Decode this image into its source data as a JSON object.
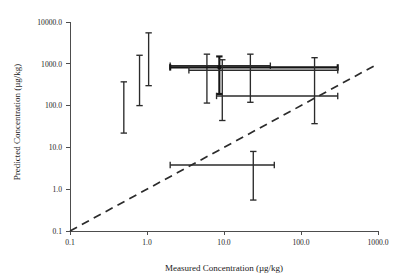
{
  "chart_data": {
    "type": "scatter",
    "title": "",
    "xlabel": "Measured Concentration (µg/kg)",
    "ylabel": "Predicted Concentration (µg/kg)",
    "xscale": "log",
    "yscale": "log",
    "xlim": [
      0.1,
      1000.0
    ],
    "ylim": [
      0.1,
      10000.0
    ],
    "grid": false,
    "legend": null,
    "x_tick_labels": [
      "0.1",
      "1.0",
      "10.0",
      "100.0",
      "1000.0"
    ],
    "x_tick_values": [
      0.1,
      1.0,
      10.0,
      100.0,
      1000.0
    ],
    "y_tick_labels": [
      "0.1",
      "1.0",
      "10.0",
      "100.0",
      "1000.0",
      "10000.0"
    ],
    "y_tick_values": [
      0.1,
      1.0,
      10.0,
      100.0,
      1000.0,
      10000.0
    ],
    "reference_line": {
      "name": "1:1 identity line",
      "style": "dashed",
      "from": [
        0.1,
        0.1
      ],
      "to": [
        1000.0,
        1000.0
      ]
    },
    "points": [
      {
        "id": "p1",
        "x": 0.5,
        "y": 110.0,
        "y_low": 22.0,
        "y_high": 370.0,
        "x_low": null,
        "x_high": null,
        "emphasis": "normal"
      },
      {
        "id": "p2",
        "x": 0.8,
        "y": 420.0,
        "y_low": 100.0,
        "y_high": 1600.0,
        "x_low": null,
        "x_high": null,
        "emphasis": "normal"
      },
      {
        "id": "p3",
        "x": 1.05,
        "y": 1300.0,
        "y_low": 300.0,
        "y_high": 5500.0,
        "x_low": null,
        "x_high": null,
        "emphasis": "normal"
      },
      {
        "id": "p4",
        "x": 6.0,
        "y": 900.0,
        "y_low": 115.0,
        "y_high": 1700.0,
        "x_low": 2.0,
        "x_high": 40.0,
        "emphasis": "normal"
      },
      {
        "id": "p5",
        "x": 8.7,
        "y": 820.0,
        "y_low": 190.0,
        "y_high": 1500.0,
        "x_low": 2.0,
        "x_high": 300.0,
        "emphasis": "strong"
      },
      {
        "id": "p6",
        "x": 9.5,
        "y": 700.0,
        "y_low": 44.0,
        "y_high": 1250.0,
        "x_low": 3.5,
        "x_high": 300.0,
        "emphasis": "normal"
      },
      {
        "id": "p7",
        "x": 22.0,
        "y": 800.0,
        "y_low": 120.0,
        "y_high": 1700.0,
        "x_low": null,
        "x_high": null,
        "emphasis": "normal"
      },
      {
        "id": "p8",
        "x": 150.0,
        "y": 170.0,
        "y_low": 37.0,
        "y_high": 1400.0,
        "x_low": 8.0,
        "x_high": 300.0,
        "emphasis": "normal"
      },
      {
        "id": "p9",
        "x": 24.0,
        "y": 3.8,
        "y_low": 0.55,
        "y_high": 8.0,
        "x_low": 2.0,
        "x_high": 45.0,
        "emphasis": "normal"
      }
    ]
  }
}
